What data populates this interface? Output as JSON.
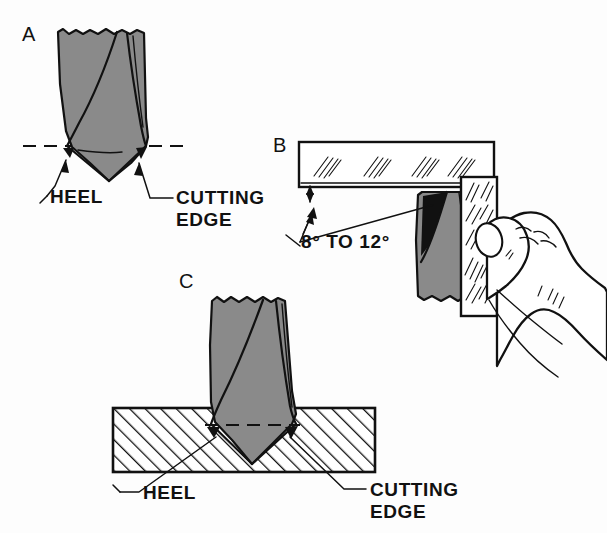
{
  "figure": {
    "background_color": "#fdfdfd",
    "ink_color": "#111111",
    "metal_fill_color": "#8a8a8a",
    "workpiece_fill_color": "#ffffff"
  },
  "panels": [
    {
      "id": "A",
      "letter": "A",
      "description": "End view of a twist drill point showing the heel and the cutting edge relative to a horizontal dashed reference line.",
      "labels": [
        {
          "name": "heel",
          "text": "HEEL"
        },
        {
          "name": "cutting-edge",
          "line1": "CUTTING",
          "line2": "EDGE"
        }
      ]
    },
    {
      "id": "B",
      "letter": "B",
      "description": "A hand holding a file against the drill point; a straightedge shows the relief angle measured from the file face.",
      "angle": {
        "name": "lip-clearance-angle",
        "text": "8° TO 12°",
        "min_degrees": 8,
        "max_degrees": 12,
        "unit": "degrees"
      }
    },
    {
      "id": "C",
      "letter": "C",
      "description": "Drill point seated in a sectioned (hatched) workpiece, showing heel and cutting edge contact.",
      "labels": [
        {
          "name": "heel",
          "text": "HEEL"
        },
        {
          "name": "cutting-edge",
          "line1": "CUTTING",
          "line2": "EDGE"
        }
      ]
    }
  ]
}
